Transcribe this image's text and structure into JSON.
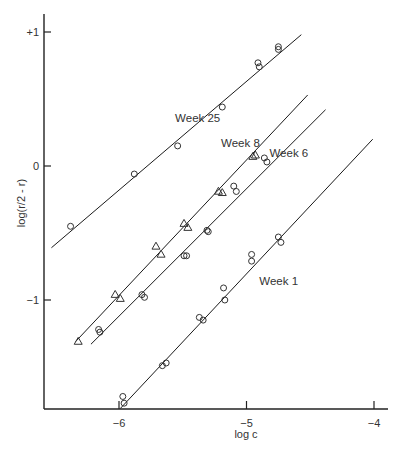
{
  "chart_data": {
    "type": "scatter",
    "title": "",
    "xlabel": "log c",
    "ylabel": "log(r/2 - r)",
    "xlim": [
      -6.59,
      -3.98
    ],
    "ylim": [
      -1.81,
      1.1
    ],
    "grid": false,
    "legend": "inline labels",
    "x_ticks": [
      {
        "value": -6,
        "label": "−6"
      },
      {
        "value": -5,
        "label": "−5"
      },
      {
        "value": -4,
        "label": "−4"
      }
    ],
    "y_ticks": [
      {
        "value": 1,
        "label": "+1"
      },
      {
        "value": 0,
        "label": "0"
      },
      {
        "value": -1,
        "label": "−1"
      }
    ],
    "series": [
      {
        "name": "Week 25",
        "marker": "circle",
        "label_pos": [
          -5.56,
          0.33
        ],
        "fit_line": [
          [
            -6.53,
            -0.61
          ],
          [
            -4.57,
            0.98
          ]
        ],
        "points": [
          [
            -6.38,
            -0.45
          ],
          [
            -5.88,
            -0.06
          ],
          [
            -5.54,
            0.15
          ],
          [
            -5.19,
            0.44
          ],
          [
            -4.91,
            0.77
          ],
          [
            -4.9,
            0.74
          ],
          [
            -4.75,
            0.89
          ],
          [
            -4.75,
            0.87
          ]
        ]
      },
      {
        "name": "Week 8",
        "marker": "triangle",
        "label_pos": [
          -5.2,
          0.14
        ],
        "fit_line": [
          [
            -6.34,
            -1.31
          ],
          [
            -4.52,
            0.53
          ]
        ],
        "points": [
          [
            -6.32,
            -1.31
          ],
          [
            -6.03,
            -0.96
          ],
          [
            -5.99,
            -0.99
          ],
          [
            -5.71,
            -0.6
          ],
          [
            -5.67,
            -0.66
          ],
          [
            -5.49,
            -0.43
          ],
          [
            -5.46,
            -0.46
          ],
          [
            -5.22,
            -0.19
          ],
          [
            -5.19,
            -0.2
          ],
          [
            -4.95,
            0.07
          ],
          [
            -4.93,
            0.08
          ]
        ]
      },
      {
        "name": "Week 6",
        "marker": "circle",
        "label_pos": [
          -4.82,
          0.07
        ],
        "fit_line": [
          [
            -6.22,
            -1.33
          ],
          [
            -4.38,
            0.42
          ]
        ],
        "points": [
          [
            -6.16,
            -1.22
          ],
          [
            -6.15,
            -1.24
          ],
          [
            -5.82,
            -0.96
          ],
          [
            -5.8,
            -0.98
          ],
          [
            -5.49,
            -0.67
          ],
          [
            -5.47,
            -0.67
          ],
          [
            -5.31,
            -0.48
          ],
          [
            -5.3,
            -0.49
          ],
          [
            -5.1,
            -0.15
          ],
          [
            -5.08,
            -0.19
          ],
          [
            -4.86,
            0.06
          ],
          [
            -4.84,
            0.03
          ]
        ]
      },
      {
        "name": "Week 1",
        "marker": "circle",
        "label_pos": [
          -4.9,
          -0.89
        ],
        "fit_line": [
          [
            -5.99,
            -1.81
          ],
          [
            -4.01,
            0.2
          ]
        ],
        "points": [
          [
            -5.97,
            -1.72
          ],
          [
            -5.96,
            -1.77
          ],
          [
            -5.66,
            -1.49
          ],
          [
            -5.63,
            -1.47
          ],
          [
            -5.37,
            -1.13
          ],
          [
            -5.34,
            -1.15
          ],
          [
            -5.18,
            -0.91
          ],
          [
            -5.17,
            -1.0
          ],
          [
            -4.96,
            -0.66
          ],
          [
            -4.96,
            -0.71
          ],
          [
            -4.75,
            -0.53
          ],
          [
            -4.73,
            -0.57
          ]
        ]
      }
    ]
  },
  "layout": {
    "plot": {
      "x0": 44,
      "y_axis_top": 14,
      "x_axis_y": 409,
      "x_axis_end": 388
    },
    "px_per_x": 127.5,
    "px_per_y": 134,
    "x_origin_value": -6,
    "x_origin_px": 119,
    "y_origin_value": 0,
    "y_origin_px": 166
  }
}
